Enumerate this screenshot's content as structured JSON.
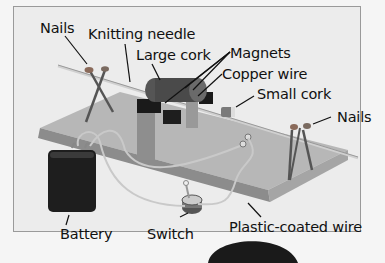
{
  "diagram": {
    "type": "labeled-illustration",
    "labels": [
      {
        "id": "nails_left",
        "text": "Nails"
      },
      {
        "id": "knitting_needle",
        "text": "Knitting needle"
      },
      {
        "id": "large_cork",
        "text": "Large cork"
      },
      {
        "id": "magnets",
        "text": "Magnets"
      },
      {
        "id": "copper_wire",
        "text": "Copper wire"
      },
      {
        "id": "small_cork",
        "text": "Small cork"
      },
      {
        "id": "nails_right",
        "text": "Nails"
      },
      {
        "id": "battery",
        "text": "Battery"
      },
      {
        "id": "switch",
        "text": "Switch"
      },
      {
        "id": "plastic_coated_wire",
        "text": "Plastic-coated wire"
      }
    ],
    "colors": {
      "background": "#f5f5f5",
      "frame": "#ececec",
      "board_top": "#b9b9b9",
      "board_side": "#8f8f8f",
      "battery": "#1c1c1c",
      "leader_lines": "#111111"
    }
  }
}
